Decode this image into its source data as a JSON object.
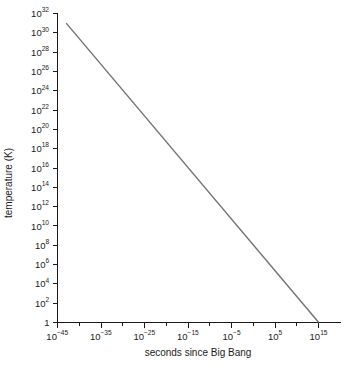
{
  "chart_data": {
    "type": "line",
    "title": "",
    "xlabel": "seconds since Big Bang",
    "ylabel": "temperature (K)",
    "xscale": "log",
    "yscale": "log",
    "xlim": [
      1e-45,
      1e+20
    ],
    "ylim": [
      1,
      1e+32
    ],
    "grid": false,
    "legend": null,
    "x_tick_labels": [
      "10⁻⁴⁵",
      "10⁻³⁵",
      "10⁻²⁵",
      "10⁻¹⁵",
      "10⁻⁵",
      "10⁵",
      "10¹⁵"
    ],
    "x_tick_bases": [
      "10",
      "10",
      "10",
      "10",
      "10",
      "10",
      "10"
    ],
    "x_tick_exponents": [
      "−45",
      "−35",
      "−25",
      "−15",
      "−5",
      "5",
      "15"
    ],
    "x_tick_values": [
      -45,
      -35,
      -25,
      -15,
      -5,
      5,
      15
    ],
    "x_minor_tick_values": [
      -40,
      -30,
      -20,
      -10,
      0,
      10
    ],
    "y_tick_labels": [
      "10³²",
      "10³⁰",
      "10²⁸",
      "10²⁶",
      "10²⁴",
      "10²²",
      "10²⁰",
      "10¹⁸",
      "10¹⁶",
      "10¹⁴",
      "10¹²",
      "10¹⁰",
      "10⁸",
      "10⁶",
      "10⁴",
      "10²",
      "1"
    ],
    "y_tick_bases": [
      "10",
      "10",
      "10",
      "10",
      "10",
      "10",
      "10",
      "10",
      "10",
      "10",
      "10",
      "10",
      "10",
      "10",
      "10",
      "10",
      "1"
    ],
    "y_tick_exponents": [
      "32",
      "30",
      "28",
      "26",
      "24",
      "22",
      "20",
      "18",
      "16",
      "14",
      "12",
      "10",
      "8",
      "6",
      "4",
      "2",
      ""
    ],
    "y_tick_values": [
      32,
      30,
      28,
      26,
      24,
      22,
      20,
      18,
      16,
      14,
      12,
      10,
      8,
      6,
      4,
      2,
      0
    ],
    "series": [
      {
        "name": "temperature vs time",
        "color": "#737373",
        "x_log10": [
          -43,
          15
        ],
        "y_log10": [
          31,
          0
        ],
        "points": [
          {
            "x_log10": -43,
            "y_log10": 31
          },
          {
            "x_log10": 15,
            "y_log10": 0
          }
        ]
      }
    ]
  },
  "axes": {
    "x_title": "seconds since Big Bang",
    "y_title": "temperature (K)"
  },
  "colors": {
    "line": "#737373",
    "axis": "#1a1a1a",
    "background": "#ffffff"
  }
}
